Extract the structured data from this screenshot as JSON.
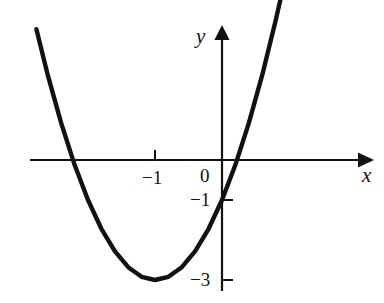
{
  "figure": {
    "background_color": "#ffffff",
    "stroke_color": "#111111"
  },
  "axes": {
    "x_axis_label": "x",
    "y_axis_label": "y",
    "origin_label": "0"
  },
  "ticks": {
    "x": [
      {
        "value": -1,
        "label": "−1"
      }
    ],
    "y": [
      {
        "value": -1,
        "label": "−1"
      },
      {
        "value": -3,
        "label": "−3"
      }
    ]
  },
  "chart_data": {
    "type": "line",
    "title": "",
    "xlabel": "x",
    "ylabel": "y",
    "grid": false,
    "legend": "none",
    "xlim": [
      -2.9,
      2.1
    ],
    "ylim": [
      -3.3,
      3.3
    ],
    "xticks": [
      -1
    ],
    "xticklabels": [
      "−1"
    ],
    "yticks": [
      -1,
      -3
    ],
    "yticklabels": [
      "−1",
      "−3"
    ],
    "annotations": [
      "0"
    ],
    "series": [
      {
        "name": "parabola",
        "equation": "y = 2(x + 1)^2 - 3",
        "vertex": [
          -1,
          -3
        ],
        "roots": [
          -2.22,
          0.22
        ],
        "y_intercept": -1,
        "x": [
          -2.77,
          -2.6,
          -2.4,
          -2.2,
          -2.0,
          -1.8,
          -1.6,
          -1.4,
          -1.2,
          -1.0,
          -0.8,
          -0.6,
          -0.4,
          -0.2,
          0.0,
          0.2,
          0.4,
          0.6,
          0.8,
          0.9
        ],
        "y": [
          3.27,
          2.12,
          0.92,
          -0.12,
          -1.0,
          -1.72,
          -2.28,
          -2.68,
          -2.92,
          -3.0,
          -2.92,
          -2.68,
          -2.28,
          -1.72,
          -1.0,
          -0.12,
          0.92,
          2.12,
          3.48,
          4.22
        ]
      }
    ]
  }
}
